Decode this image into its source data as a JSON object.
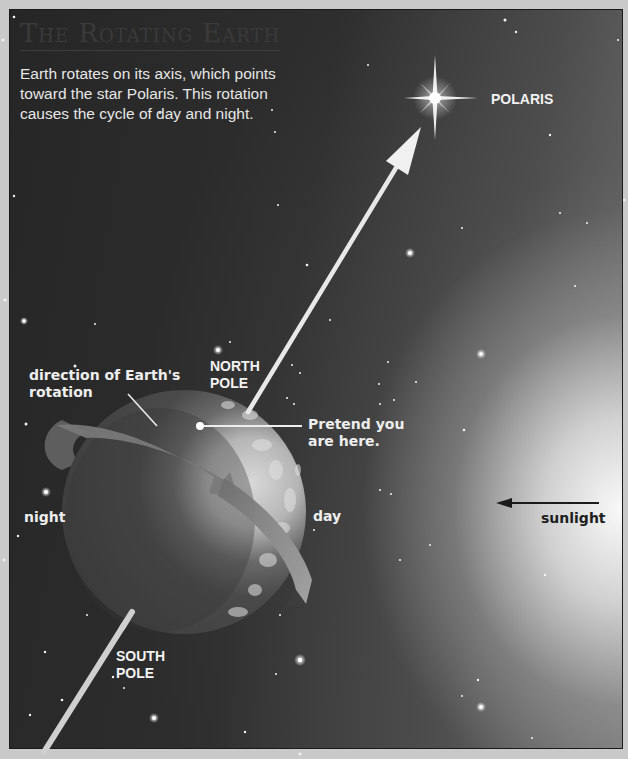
{
  "title": "The Rotating Earth",
  "caption": {
    "line1": "Earth rotates on its axis, which points",
    "line2": "toward the star Polaris. This rotation",
    "line3": "causes the cycle of day and night."
  },
  "labels": {
    "polaris": "POLARIS",
    "north_pole_1": "NORTH",
    "north_pole_2": "POLE",
    "south_pole_1": "SOUTH",
    "south_pole_2": "POLE",
    "rotation_1": "direction of Earth's",
    "rotation_2": "rotation",
    "pretend_1": "Pretend you",
    "pretend_2": "are here.",
    "night": "night",
    "day": "day",
    "sunlight": "sunlight"
  },
  "colors": {
    "frame": "#c9c9c9",
    "space": "#2a2a2a",
    "label": "#f2f2f2",
    "sunlight_label": "#1e1e1e"
  },
  "icons": {
    "polaris_star": "four-point-star",
    "axis_arrow": "arrow-up-right",
    "sunlight_arrow": "arrow-left",
    "rotation_arrow": "curved-arrow"
  }
}
